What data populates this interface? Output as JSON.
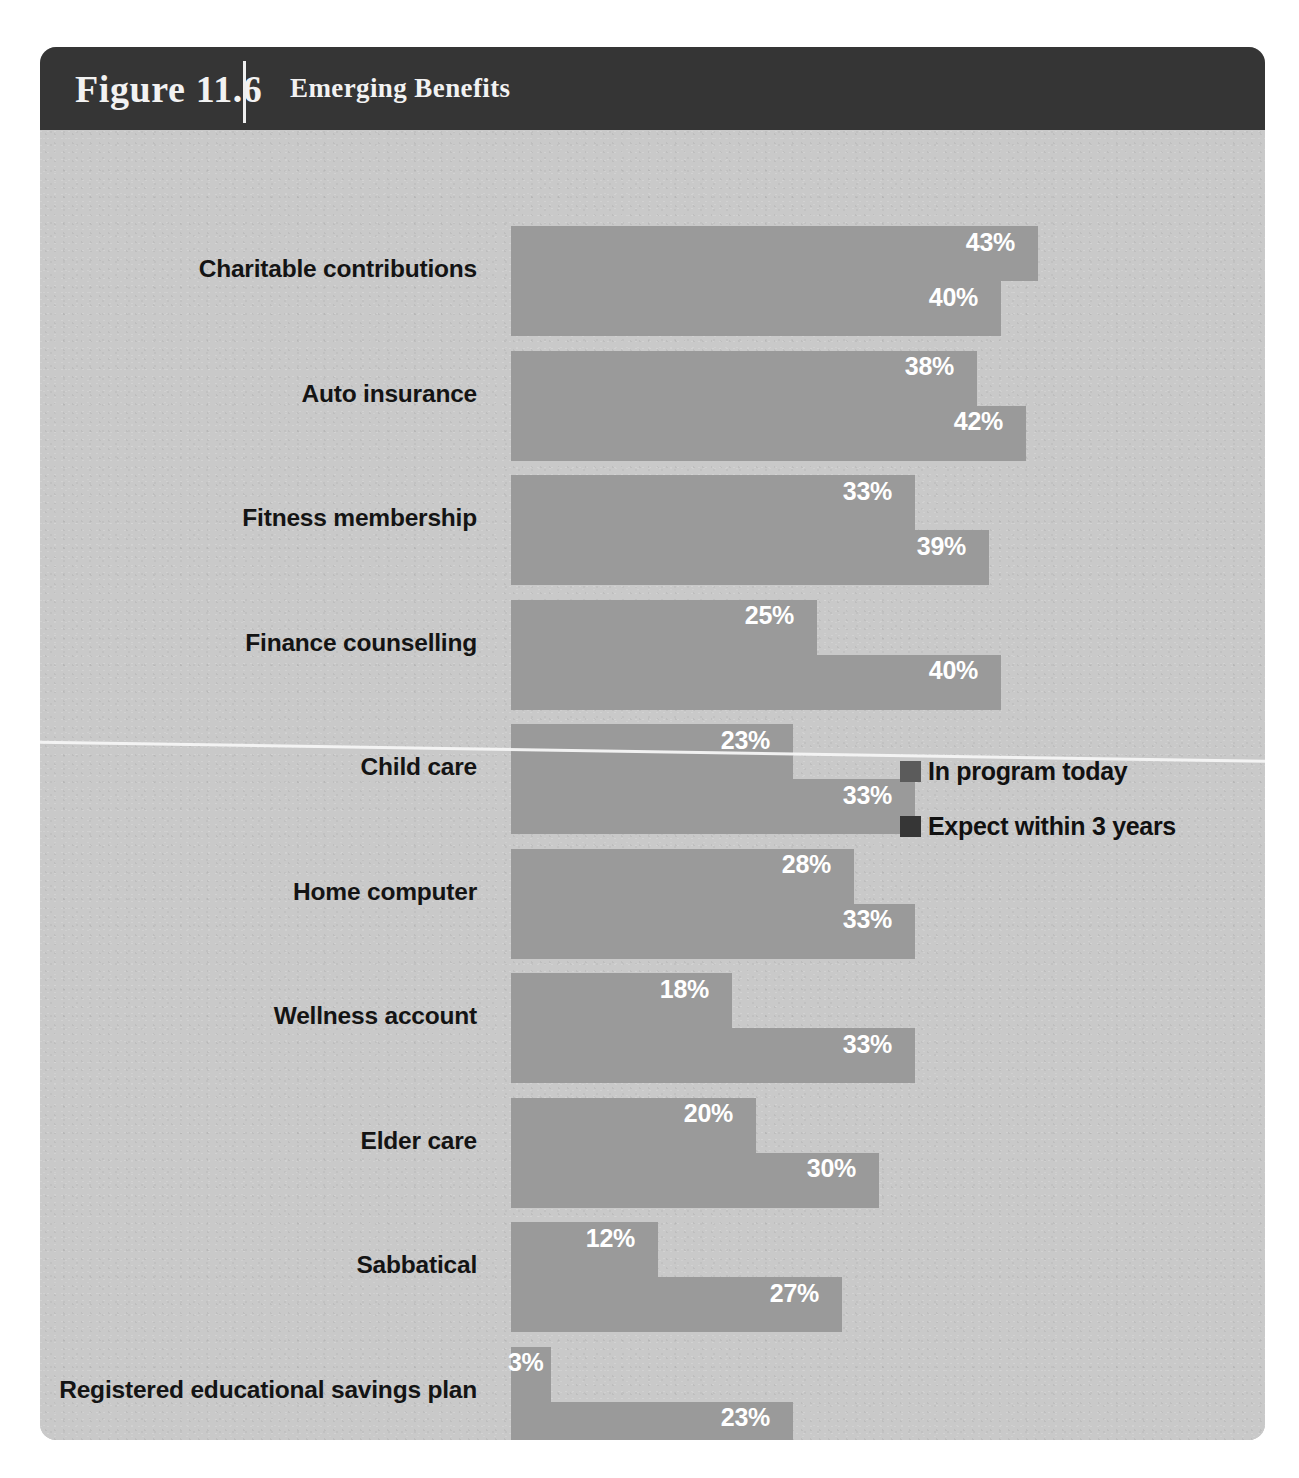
{
  "figure": {
    "number": "Figure 11.6",
    "title": "Emerging Benefits"
  },
  "colors": {
    "header_bg": "#353535",
    "body_bg": "#c9c9c9",
    "series_light": "#5b5b5b",
    "series_dark": "#363636",
    "shadow": "#9a9a9a",
    "value_text": "#ffffff",
    "label_text": "#141414"
  },
  "legend": {
    "items": [
      {
        "label": "In program today",
        "color": "#5b5b5b",
        "swatch": "series-light-swatch"
      },
      {
        "label": "Expect within 3 years",
        "color": "#363636",
        "swatch": "series-dark-swatch"
      }
    ]
  },
  "chart_data": {
    "type": "bar",
    "orientation": "horizontal",
    "title": "Emerging Benefits",
    "xlabel": "",
    "ylabel": "",
    "grid": false,
    "legend_position": "middle-right",
    "value_format": "percent",
    "xlim": [
      0,
      45
    ],
    "categories": [
      "Charitable contributions",
      "Auto insurance",
      "Fitness membership",
      "Finance counselling",
      "Child care",
      "Home computer",
      "Wellness account",
      "Elder care",
      "Sabbatical",
      "Registered educational savings plan"
    ],
    "series": [
      {
        "name": "In program today",
        "color": "#5b5b5b",
        "values": [
          43,
          38,
          33,
          25,
          23,
          28,
          18,
          20,
          12,
          3
        ],
        "labels": [
          "43%",
          "38%",
          "33%",
          "25%",
          "23%",
          "28%",
          "18%",
          "20%",
          "12%",
          "3%"
        ]
      },
      {
        "name": "Expect within 3 years",
        "color": "#363636",
        "values": [
          40,
          42,
          39,
          40,
          33,
          33,
          33,
          30,
          27,
          23
        ],
        "labels": [
          "40%",
          "42%",
          "39%",
          "40%",
          "33%",
          "33%",
          "33%",
          "30%",
          "27%",
          "23%"
        ]
      }
    ]
  }
}
